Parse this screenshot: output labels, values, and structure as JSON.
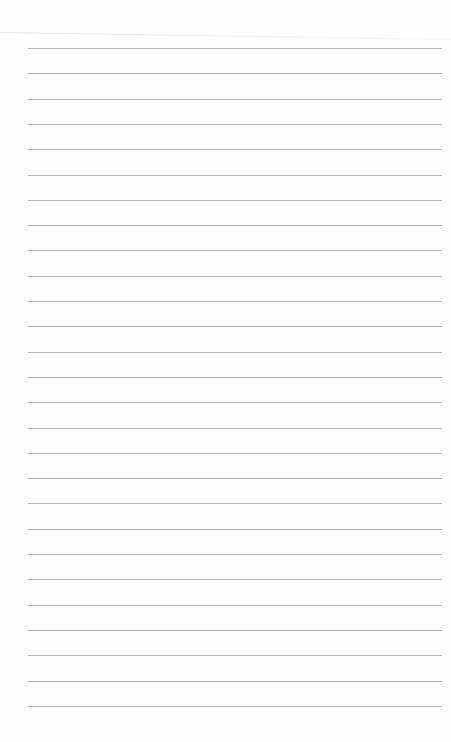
{
  "page": {
    "type": "lined-paper",
    "line_count": 27,
    "line_color": "#b9b9b9",
    "background": "#fefefe",
    "first_line_y": 48,
    "line_spacing": 25.3
  }
}
